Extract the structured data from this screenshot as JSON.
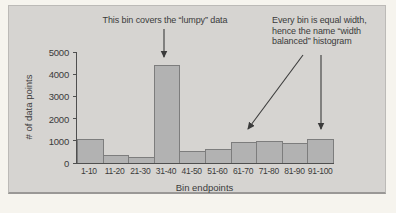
{
  "panel": {
    "bg": "#d6d4d1"
  },
  "annotations": {
    "lumpy": {
      "text": "This bin covers the “lumpy” data"
    },
    "equal_width": {
      "lines": [
        "Every bin is equal width,",
        "hence the name “width",
        "balanced” histogram"
      ]
    }
  },
  "chart_data": {
    "type": "bar",
    "title": "",
    "xlabel": "Bin endpoints",
    "ylabel": "# of data points",
    "categories": [
      "1-10",
      "11-20",
      "21-30",
      "31-40",
      "41-50",
      "51-60",
      "61-70",
      "71-80",
      "81-90",
      "91-100"
    ],
    "values": [
      1100,
      350,
      250,
      4400,
      550,
      650,
      950,
      1000,
      900,
      1100
    ],
    "ylim": [
      0,
      5000
    ],
    "yticks": [
      0,
      1000,
      2000,
      3000,
      4000,
      5000
    ],
    "grid": false,
    "legend": "none",
    "colors": {
      "bar_fill": "#b2b2b2",
      "bar_border": "#7d7d7d",
      "axis": "#4f4f4f",
      "text": "#3b3b3b"
    }
  }
}
